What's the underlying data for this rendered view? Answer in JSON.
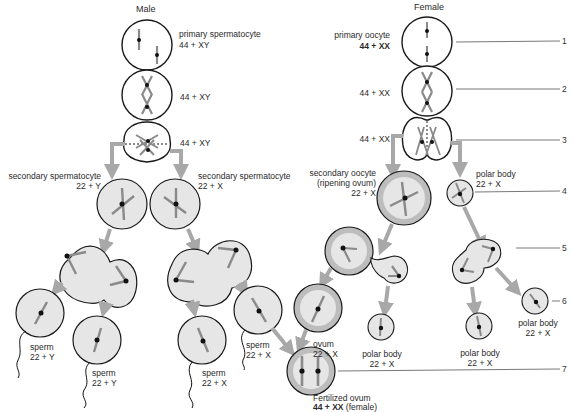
{
  "headers": {
    "male": "Male",
    "female": "Female"
  },
  "male": {
    "primary": {
      "name": "primary spermatocyte",
      "karyotype": "44 + XY"
    },
    "stage2": {
      "karyotype": "44 + XY"
    },
    "stage3": {
      "karyotype": "44 + XY"
    },
    "secondary_left": {
      "name": "secondary spermatocyte",
      "karyotype": "22 + Y"
    },
    "secondary_right": {
      "name": "secondary spermatocyte",
      "karyotype": "22 + X"
    },
    "sperm": [
      {
        "name": "sperm",
        "karyotype": "22 + Y"
      },
      {
        "name": "sperm",
        "karyotype": "22 + Y"
      },
      {
        "name": "sperm",
        "karyotype": "22 + X"
      },
      {
        "name": "sperm",
        "karyotype": "22 + X"
      }
    ]
  },
  "female": {
    "primary": {
      "name": "primary oocyte",
      "karyotype": "44 + XX"
    },
    "stage2": {
      "karyotype": "44 + XX"
    },
    "stage3": {
      "karyotype": "44 + XX"
    },
    "secondary": {
      "name": "secondary oocyte",
      "name2": "(ripening ovum)",
      "karyotype": "22 + X"
    },
    "polar_body_1": {
      "name": "polar body",
      "karyotype": "22 + X"
    },
    "ovum": {
      "name": "ovum",
      "karyotype": "22 + X"
    },
    "polar_bodies": [
      {
        "name": "polar body",
        "karyotype": "22 + X"
      },
      {
        "name": "polar body",
        "karyotype": "22 + X"
      },
      {
        "name": "polar body",
        "karyotype": "22 + X"
      }
    ]
  },
  "fertilized": {
    "name": "Fertilized ovum",
    "karyotype": "44 + XX",
    "sex": "(female)"
  },
  "callouts": [
    "1",
    "2",
    "3",
    "4",
    "5",
    "6",
    "7"
  ],
  "colors": {
    "cell_fill": "#e6e6e6",
    "cell_stroke": "#1a1a1a",
    "arrow": "#a8a8a8",
    "chromosome": "#8a8a8a",
    "centromere": "#111111",
    "ovum_ring": "#b8b8b8"
  }
}
